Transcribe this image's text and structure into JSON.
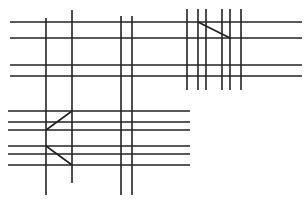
{
  "diagram": {
    "width": 308,
    "height": 204,
    "background": "#ffffff",
    "stroke_color": "#222222",
    "stroke_width": 1.6,
    "groups": [
      {
        "name": "upper-horizontal-lines",
        "lines": [
          {
            "x1": 10,
            "y1": 22,
            "x2": 302,
            "y2": 22
          },
          {
            "x1": 10,
            "y1": 38,
            "x2": 302,
            "y2": 38
          },
          {
            "x1": 10,
            "y1": 65,
            "x2": 302,
            "y2": 65
          },
          {
            "x1": 10,
            "y1": 76,
            "x2": 302,
            "y2": 76
          }
        ]
      },
      {
        "name": "lower-horizontal-lines",
        "lines": [
          {
            "x1": 8,
            "y1": 111,
            "x2": 190,
            "y2": 111
          },
          {
            "x1": 8,
            "y1": 122,
            "x2": 190,
            "y2": 122
          },
          {
            "x1": 8,
            "y1": 130,
            "x2": 190,
            "y2": 130
          },
          {
            "x1": 8,
            "y1": 146,
            "x2": 190,
            "y2": 146
          },
          {
            "x1": 8,
            "y1": 154,
            "x2": 190,
            "y2": 154
          },
          {
            "x1": 8,
            "y1": 165,
            "x2": 190,
            "y2": 165
          }
        ]
      },
      {
        "name": "left-vertical-lines",
        "lines": [
          {
            "x1": 46,
            "y1": 18,
            "x2": 46,
            "y2": 195
          },
          {
            "x1": 72,
            "y1": 10,
            "x2": 72,
            "y2": 183
          },
          {
            "x1": 121,
            "y1": 16,
            "x2": 121,
            "y2": 195
          },
          {
            "x1": 132,
            "y1": 16,
            "x2": 132,
            "y2": 195
          }
        ]
      },
      {
        "name": "upper-right-vertical-lines",
        "lines": [
          {
            "x1": 187,
            "y1": 9,
            "x2": 187,
            "y2": 90
          },
          {
            "x1": 198,
            "y1": 9,
            "x2": 198,
            "y2": 90
          },
          {
            "x1": 206,
            "y1": 9,
            "x2": 206,
            "y2": 90
          },
          {
            "x1": 222,
            "y1": 9,
            "x2": 222,
            "y2": 90
          },
          {
            "x1": 230,
            "y1": 9,
            "x2": 230,
            "y2": 90
          },
          {
            "x1": 241,
            "y1": 9,
            "x2": 241,
            "y2": 90
          }
        ]
      },
      {
        "name": "diagonal-connectors",
        "lines": [
          {
            "x1": 198,
            "y1": 22,
            "x2": 230,
            "y2": 38
          },
          {
            "x1": 72,
            "y1": 111,
            "x2": 46,
            "y2": 130
          },
          {
            "x1": 46,
            "y1": 146,
            "x2": 72,
            "y2": 165
          }
        ]
      }
    ]
  }
}
